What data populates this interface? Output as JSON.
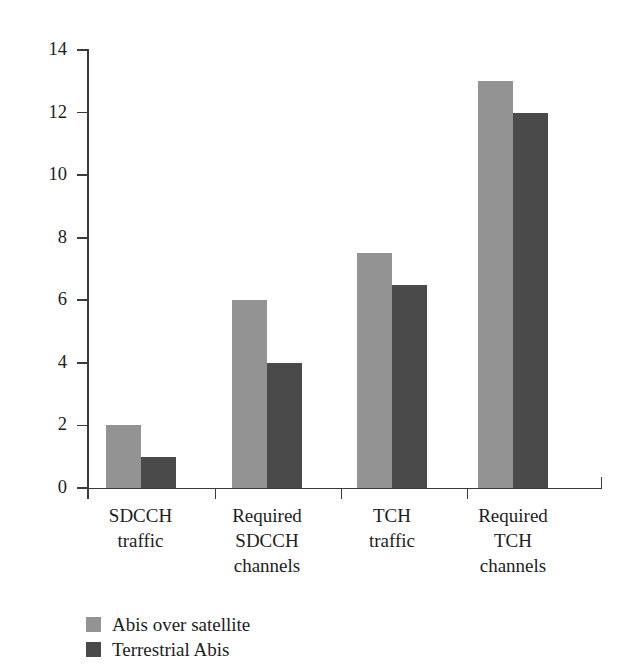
{
  "chart_data": {
    "type": "bar",
    "title": "",
    "subtitle": "",
    "xlabel": "",
    "ylabel": "",
    "categories": [
      "SDCCH\ntraffic",
      "Required\nSDCCH\nchannels",
      "TCH\ntraffic",
      "Required\nTCH\nchannels"
    ],
    "category_lines": [
      [
        "SDCCH",
        "traffic"
      ],
      [
        "Required",
        "SDCCH",
        "channels"
      ],
      [
        "TCH",
        "traffic"
      ],
      [
        "Required",
        "TCH",
        "channels"
      ]
    ],
    "series": [
      {
        "name": "Abis over satellite",
        "color": "#939393",
        "values": [
          2,
          6,
          7.5,
          13
        ]
      },
      {
        "name": "Terrestrial Abis",
        "color": "#4a4a4a",
        "values": [
          1,
          4,
          6.5,
          12
        ]
      }
    ],
    "ylim": [
      0,
      14
    ],
    "yticks": [
      0,
      2,
      4,
      6,
      8,
      10,
      12,
      14
    ],
    "ytick_labels": [
      "0",
      "2",
      "4",
      "6",
      "8",
      "10",
      "12",
      "14"
    ],
    "grid": false,
    "legend_position": "bottom-left",
    "background_color": "#ffffff",
    "axis_color": "#3a3a3a"
  }
}
